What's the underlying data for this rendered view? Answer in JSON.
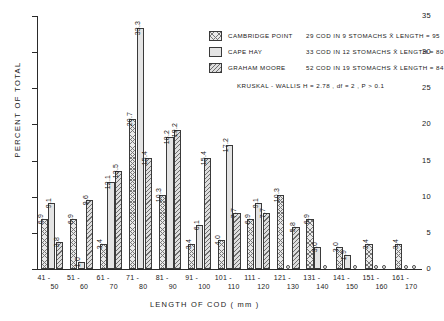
{
  "chart_data": {
    "type": "bar",
    "title": "",
    "xlabel": "LENGTH OF COD ( mm )",
    "ylabel": "PERCENT OF TOTAL",
    "ylim": [
      0,
      35
    ],
    "yticks": [
      0,
      5,
      10,
      15,
      20,
      25,
      30,
      35
    ],
    "grid": false,
    "legend_position": "top-right",
    "categories": [
      "41-50",
      "51-60",
      "61-70",
      "71-80",
      "81-90",
      "91-100",
      "101-110",
      "111-120",
      "121-130",
      "131-140",
      "141-150",
      "151-160",
      "161-170"
    ],
    "category_parts": [
      {
        "lo": "41 -",
        "hi": "50"
      },
      {
        "lo": "51 -",
        "hi": "60"
      },
      {
        "lo": "61 -",
        "hi": "70"
      },
      {
        "lo": "71 -",
        "hi": "80"
      },
      {
        "lo": "81 -",
        "hi": "90"
      },
      {
        "lo": "91 -",
        "hi": "100"
      },
      {
        "lo": "101 -",
        "hi": "110"
      },
      {
        "lo": "111 -",
        "hi": "120"
      },
      {
        "lo": "121 -",
        "hi": "130"
      },
      {
        "lo": "131 -",
        "hi": "140"
      },
      {
        "lo": "141 -",
        "hi": "150"
      },
      {
        "lo": "151 -",
        "hi": "160"
      },
      {
        "lo": "161 -",
        "hi": "170"
      }
    ],
    "series": [
      {
        "name": "CAMBRIDGE POINT",
        "pattern": "cross",
        "values": [
          6.9,
          6.9,
          3.4,
          20.7,
          10.3,
          3.4,
          4.0,
          6.9,
          10.3,
          6.9,
          3.0,
          3.4,
          3.4
        ]
      },
      {
        "name": "CAPE HAY",
        "pattern": "plain",
        "values": [
          9.1,
          1.0,
          12.1,
          33.3,
          18.2,
          6.1,
          17.2,
          9.1,
          0,
          3.0,
          1.9,
          0,
          0
        ]
      },
      {
        "name": "GRAHAM MOORE",
        "pattern": "diag",
        "values": [
          3.8,
          9.6,
          13.5,
          15.4,
          19.2,
          15.4,
          7.7,
          7.7,
          5.8,
          0,
          0,
          0,
          0
        ]
      }
    ]
  },
  "legend": {
    "rows": [
      {
        "name": "CAMBRIDGE POINT",
        "stat": "29 COD  IN 9 STOMACHS  X̄ LENGTH = 95",
        "pattern": "cross"
      },
      {
        "name": "CAPE HAY",
        "stat": "33 COD  IN 12 STOMACHS  X̄ LENGTH = 80",
        "pattern": "plain"
      },
      {
        "name": "GRAHAM MOORE",
        "stat": "52 COD  IN 19 STOMACHS  X̄ LENGTH = 84",
        "pattern": "diag"
      }
    ],
    "kruskal_wallis": "KRUSKAL - WALLIS  H = 2.78 , df = 2 , P > 0.1"
  }
}
